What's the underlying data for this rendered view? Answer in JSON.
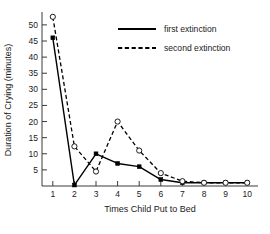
{
  "chart_data": {
    "type": "line",
    "title": "",
    "xlabel": "Times Child Put to Bed",
    "ylabel": "Duration of Crying (minutes)",
    "x": [
      1,
      2,
      3,
      4,
      5,
      6,
      7,
      8,
      9,
      10
    ],
    "xticklabels": [
      "1",
      "2",
      "3",
      "4",
      "5",
      "6",
      "7",
      "8",
      "9",
      "10"
    ],
    "yticklabels": [
      "5",
      "10",
      "15",
      "20",
      "25",
      "30",
      "35",
      "40",
      "45",
      "50"
    ],
    "yticks": [
      5,
      10,
      15,
      20,
      25,
      30,
      35,
      40,
      45,
      50
    ],
    "xlim": [
      0.5,
      10.5
    ],
    "ylim": [
      0,
      54
    ],
    "grid": false,
    "legend_position": "top-right",
    "series": [
      {
        "name": "first extinction",
        "style": "solid",
        "marker": "filled-square",
        "color": "#000000",
        "values": [
          46,
          0.3,
          10,
          7,
          6,
          2,
          1,
          1,
          1,
          1
        ]
      },
      {
        "name": "second extinction",
        "style": "dashed",
        "marker": "open-circle",
        "color": "#000000",
        "values": [
          52.5,
          12.3,
          4.5,
          20,
          11,
          4,
          1.5,
          1,
          1,
          1
        ]
      }
    ]
  },
  "legend": {
    "entries": [
      {
        "label": "first extinction"
      },
      {
        "label": "second extinction"
      }
    ]
  }
}
